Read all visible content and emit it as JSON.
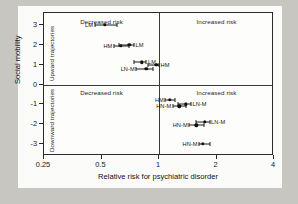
{
  "chart_data": {
    "type": "scatter",
    "title": "",
    "xlabel": "Relative risk for psychiatric disorder",
    "ylabel": "Social mobility",
    "xscale": "log",
    "xlim": [
      0.25,
      4
    ],
    "ylim": [
      -3.6,
      3.6
    ],
    "xticks": [
      0.25,
      0.5,
      1,
      2,
      4
    ],
    "xtick_labels": [
      "0.25",
      "0.5",
      "1",
      "2",
      "4"
    ],
    "yticks": [
      3,
      2,
      1,
      0,
      -1,
      -2,
      -3
    ],
    "ytick_labels": [
      "3",
      "2",
      "1",
      "0",
      "-1",
      "-2",
      "-3"
    ],
    "grid": false,
    "legend": "none",
    "reference_lines": {
      "x": 1,
      "y": 0
    },
    "annotations": {
      "quadrant_top_left": "Decreased risk",
      "quadrant_top_right": "Increased risk",
      "quadrant_bottom_left": "Decreased risk",
      "quadrant_bottom_right": "Increased risk",
      "region_upper": "Upward trajectories",
      "region_lower": "Downward trajectories"
    },
    "points": [
      {
        "label": "LM",
        "x": 0.52,
        "xlow": 0.46,
        "xhigh": 0.6,
        "y": 3.0,
        "label_side": "left"
      },
      {
        "label": "LM",
        "x": 0.7,
        "xlow": 0.62,
        "xhigh": 0.74,
        "y": 2.0,
        "label_side": "right"
      },
      {
        "label": "HM",
        "x": 0.63,
        "xlow": 0.58,
        "xhigh": 0.7,
        "y": 1.95,
        "label_side": "left"
      },
      {
        "label": "LM",
        "x": 0.81,
        "xlow": 0.74,
        "xhigh": 0.86,
        "y": 1.12,
        "label_side": "right"
      },
      {
        "label": "HM",
        "x": 0.97,
        "xlow": 0.88,
        "xhigh": 1.0,
        "y": 1.0,
        "label_side": "right"
      },
      {
        "label": "LN-M",
        "x": 0.86,
        "xlow": 0.76,
        "xhigh": 0.93,
        "y": 0.8,
        "label_side": "left"
      },
      {
        "label": "HM",
        "x": 1.14,
        "xlow": 1.08,
        "xhigh": 1.21,
        "y": -0.78,
        "label_side": "left"
      },
      {
        "label": "LN-M",
        "x": 1.38,
        "xlow": 1.26,
        "xhigh": 1.47,
        "y": -1.0,
        "label_side": "right"
      },
      {
        "label": "HN-M",
        "x": 1.28,
        "xlow": 1.18,
        "xhigh": 1.38,
        "y": -1.1,
        "label_side": "left"
      },
      {
        "label": "LN-M",
        "x": 1.74,
        "xlow": 1.57,
        "xhigh": 1.84,
        "y": -1.88,
        "label_side": "right"
      },
      {
        "label": "HN-M",
        "x": 1.57,
        "xlow": 1.44,
        "xhigh": 1.72,
        "y": -2.05,
        "label_side": "left"
      },
      {
        "label": "HN-M",
        "x": 1.7,
        "xlow": 1.62,
        "xhigh": 1.86,
        "y": -3.0,
        "label_side": "left"
      }
    ]
  }
}
